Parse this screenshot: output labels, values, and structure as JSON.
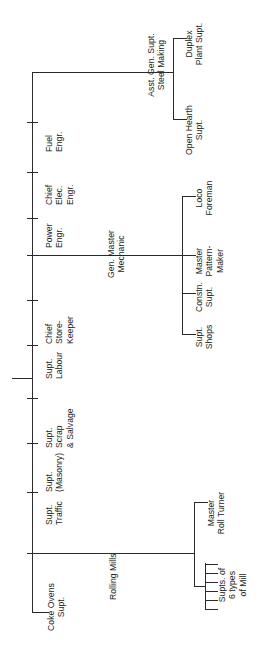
{
  "chart": {
    "orientation": "rotated-90-ccw",
    "line_color": "#2b2b2b",
    "text_color": "#1a1a1a",
    "background": "#ffffff"
  },
  "nodes": {
    "steel_making": "Asst. Gen. Supt.\nSteel Making",
    "duplex_plant": "Duplex\nPlant Supt.",
    "open_hearth": "Open Hearth\nSupt.",
    "fuel_engr": "Fuel\nEngr.",
    "chief_elec_engr": "Chief\nElec.\nEngr.",
    "power_engr": "Power\nEngr.",
    "gen_master_mechanic": "Gen. Master\nMechanic",
    "loco_foreman": "Loco\nForeman",
    "master_pattern_maker": "Master\nPattern-\nMaker",
    "constn_supt": "Constn.\nSupt.",
    "supt_shops": "Supt.\nShops",
    "chief_store_keeper": "Chief\nStore-\nKeeper",
    "supt_labour": "Supt.\nLabour",
    "supt_scrap_salvage": "Supt.\nScrap\n& Salvage",
    "supt_masonry": "Supt.\n(Masonry)",
    "supt_traffic": "Supt.\nTraffic",
    "rolling_mills": "Rolling Mills",
    "master_roll_turner": "Master\nRoll Turner",
    "supts_six_mills": "Supts. of\n6 types\nof Mill",
    "coke_ovens_supt": "Coke Ovens\nSupt."
  }
}
